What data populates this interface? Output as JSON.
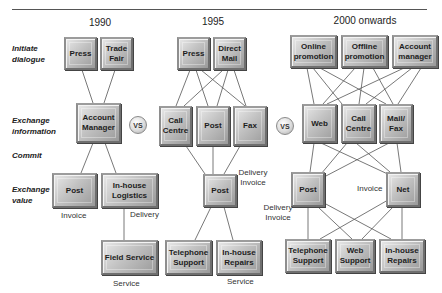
{
  "header": {
    "title_partial": "",
    "rule": true
  },
  "stages": [
    {
      "id": "initiate",
      "label": "Initiate dialogue"
    },
    {
      "id": "exchange-info",
      "label": "Exchange information"
    },
    {
      "id": "commit",
      "label": "Commit"
    },
    {
      "id": "exchange-value",
      "label": "Exchange value"
    }
  ],
  "comparator": "VS",
  "eras": [
    {
      "label": "1990",
      "nodes": {
        "press": "Press",
        "trade_fair": "Trade Fair",
        "account_manager": "Account Manager",
        "post": "Post",
        "inhouse_logistics": "In-house Logistics",
        "field_service": "Field Service"
      },
      "annotations": {
        "invoice": "Invoice",
        "delivery": "Delivery",
        "service": "Service"
      }
    },
    {
      "label": "1995",
      "nodes": {
        "press": "Press",
        "direct_mail": "Direct Mail",
        "call_centre": "Call Centre",
        "post_info": "Post",
        "fax": "Fax",
        "post_value": "Post",
        "telephone_support": "Telephone Support",
        "inhouse_repairs": "In-house Repairs"
      },
      "annotations": {
        "delivery_invoice": "Delivery Invoice",
        "service": "Service"
      }
    },
    {
      "label": "2000 onwards",
      "nodes": {
        "online_promotion": "Online promotion",
        "offline_promotion": "Offline promotion",
        "account_manager": "Account manager",
        "web": "Web",
        "call_centre": "Call Centre",
        "mail_fax": "Mail/ Fax",
        "post": "Post",
        "net": "Net",
        "telephone_support": "Telephone Support",
        "web_support": "Web Support",
        "inhouse_repairs": "In-house Repairs"
      },
      "annotations": {
        "delivery_invoice": "Delivery Invoice",
        "invoice": "Invoice"
      }
    }
  ],
  "colors": {
    "box_light": "#e8e8e8",
    "box_mid": "#c2c2c2",
    "box_dark": "#9a9a9a",
    "line": "#555555"
  }
}
